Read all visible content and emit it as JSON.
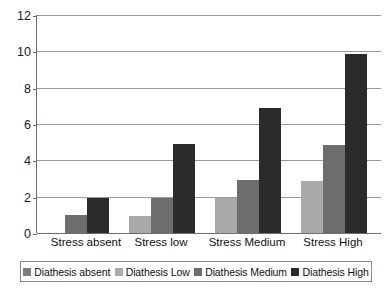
{
  "chart_data": {
    "type": "bar",
    "title": "",
    "subtitle": "",
    "xlabel": "",
    "ylabel": "",
    "ylim": [
      0,
      12
    ],
    "yticks": [
      0,
      2,
      4,
      6,
      8,
      10,
      12
    ],
    "ytick_labels": [
      "0",
      "2",
      "4",
      "6",
      "8",
      "10",
      "12"
    ],
    "grid": true,
    "legend_position": "bottom",
    "categories": [
      "Stress absent",
      "Stress low",
      "Stress Medium",
      "Stress High"
    ],
    "series": [
      {
        "name": "Diathesis absent",
        "color": "#7d7d7d",
        "values": [
          0,
          0,
          0,
          0
        ]
      },
      {
        "name": "Diathesis Low",
        "color": "#a9a9a9",
        "values": [
          0,
          0.95,
          1.9,
          2.85
        ]
      },
      {
        "name": "Diathesis Medium",
        "color": "#6d6d6d",
        "values": [
          1.0,
          1.95,
          2.9,
          4.85
        ]
      },
      {
        "name": "Diathesis High",
        "color": "#2b2b2b",
        "values": [
          1.95,
          4.9,
          6.9,
          9.85
        ]
      }
    ]
  },
  "axis": {
    "line_color": "#6e6e6e",
    "grid_color": "#9b9b9b"
  },
  "legend": {
    "items": [
      {
        "label": "Diathesis absent",
        "color": "#7d7d7d"
      },
      {
        "label": "Diathesis Low",
        "color": "#a9a9a9"
      },
      {
        "label": "Diathesis Medium",
        "color": "#6d6d6d"
      },
      {
        "label": "Diathesis High",
        "color": "#2b2b2b"
      }
    ]
  }
}
